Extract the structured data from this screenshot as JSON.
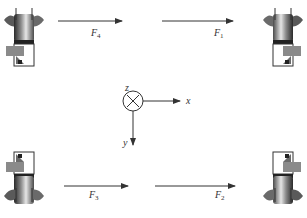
{
  "diagram": {
    "forces": [
      {
        "id": "F4",
        "label": "F",
        "subscript": "4",
        "position": "top-left",
        "direction": "+x"
      },
      {
        "id": "F1",
        "label": "F",
        "subscript": "1",
        "position": "top-right",
        "direction": "+x"
      },
      {
        "id": "F3",
        "label": "F",
        "subscript": "3",
        "position": "bottom-left",
        "direction": "+x"
      },
      {
        "id": "F2",
        "label": "F",
        "subscript": "2",
        "position": "bottom-right",
        "direction": "+x"
      }
    ],
    "axes": {
      "x": "x",
      "y": "y",
      "z": "z",
      "z_symbol": "into-page (⊗)"
    },
    "units": [
      {
        "id": "unit-top-left",
        "orientation": "wheel-up"
      },
      {
        "id": "unit-top-right",
        "orientation": "wheel-up-mirrored"
      },
      {
        "id": "unit-bottom-left",
        "orientation": "wheel-down"
      },
      {
        "id": "unit-bottom-right",
        "orientation": "wheel-down-mirrored"
      }
    ],
    "colors": {
      "line": "#333333",
      "wheel_dark": "#3a3a3a",
      "wheel_light": "#d8d8d8",
      "box_fill": "#8a8a8a"
    }
  }
}
